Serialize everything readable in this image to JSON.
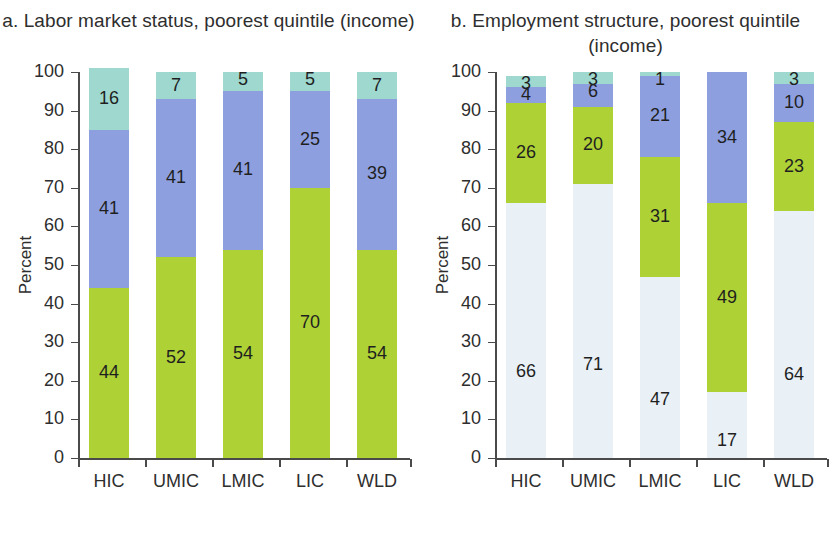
{
  "figure": {
    "width": 834,
    "height": 557
  },
  "colors": {
    "teal": "#9ed8cf",
    "blue": "#8e9fe0",
    "green": "#aed136",
    "pale": "#e9f1f6",
    "axis": "#4a4a4a",
    "text": "#2e2e2e"
  },
  "panels": [
    {
      "id": "panel-a",
      "title": "a. Labor market status, poorest quintile (income)",
      "ylabel": "Percent",
      "yticks": [
        "100",
        "90",
        "80",
        "70",
        "60",
        "50",
        "40",
        "30",
        "20",
        "10",
        "0"
      ],
      "ylim": [
        0,
        100
      ],
      "categories": [
        "HIC",
        "UMIC",
        "LMIC",
        "LIC",
        "WLD"
      ],
      "legend": [
        {
          "label": "Unemployed",
          "color": "#9ed8cf"
        },
        {
          "label": "Inactive",
          "color": "#8e9fe0"
        },
        {
          "label": "Employed",
          "color": "#aed136"
        }
      ]
    },
    {
      "id": "panel-b",
      "title": "b. Employment structure, poorest quintile (income)",
      "ylabel": "Percent",
      "yticks": [
        "100",
        "90",
        "80",
        "70",
        "60",
        "50",
        "40",
        "30",
        "20",
        "10",
        "0"
      ],
      "ylim": [
        0,
        100
      ],
      "categories": [
        "HIC",
        "UMIC",
        "LMIC",
        "LIC",
        "WLD"
      ],
      "legend": [
        {
          "label": "Wage employees",
          "color": "#9ed8cf"
        },
        {
          "label": "Self-employed",
          "color": "#aed136"
        },
        {
          "label": "Unpaid",
          "color": "#8e9fe0"
        },
        {
          "label": "Wage employees",
          "color": "#e9f1f6"
        }
      ]
    }
  ],
  "chart_data": [
    {
      "type": "bar",
      "stacked": true,
      "title": "a. Labor market status, poorest quintile (income)",
      "xlabel": "",
      "ylabel": "Percent",
      "ylim": [
        0,
        100
      ],
      "ytick_step": 10,
      "grid": false,
      "legend_position": "bottom",
      "categories": [
        "HIC",
        "UMIC",
        "LMIC",
        "LIC",
        "WLD"
      ],
      "series": [
        {
          "name": "Employed",
          "color": "#aed136",
          "values": [
            44,
            52,
            54,
            70,
            54
          ]
        },
        {
          "name": "Inactive",
          "color": "#8e9fe0",
          "values": [
            41,
            41,
            41,
            25,
            39
          ]
        },
        {
          "name": "Unemployed",
          "color": "#9ed8cf",
          "values": [
            16,
            7,
            5,
            5,
            7
          ]
        }
      ]
    },
    {
      "type": "bar",
      "stacked": true,
      "title": "b. Employment structure, poorest quintile (income)",
      "xlabel": "",
      "ylabel": "Percent",
      "ylim": [
        0,
        100
      ],
      "ytick_step": 10,
      "grid": false,
      "legend_position": "bottom",
      "categories": [
        "HIC",
        "UMIC",
        "LMIC",
        "LIC",
        "WLD"
      ],
      "series": [
        {
          "name": "Wage employees",
          "color": "#e9f1f6",
          "values": [
            66,
            71,
            47,
            17,
            64
          ]
        },
        {
          "name": "Self-employed",
          "color": "#aed136",
          "values": [
            26,
            20,
            31,
            49,
            23
          ]
        },
        {
          "name": "Unpaid",
          "color": "#8e9fe0",
          "values": [
            4,
            6,
            21,
            34,
            10
          ]
        },
        {
          "name": "Wage employees",
          "color": "#9ed8cf",
          "values": [
            3,
            3,
            1,
            0,
            3
          ]
        }
      ]
    }
  ]
}
